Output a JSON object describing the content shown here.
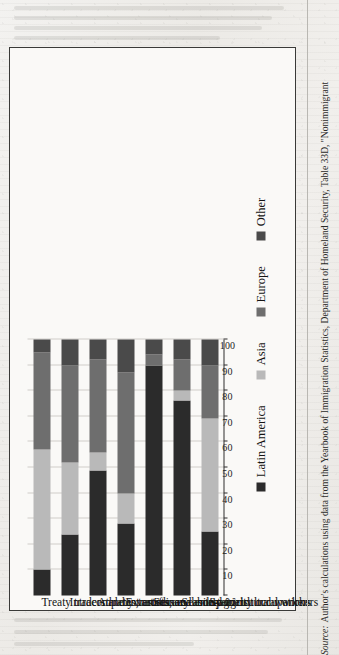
{
  "figure": {
    "source_prefix": "Source:",
    "source_text": "Author's calculations using data from the Yearbook of Immigration Statistics, Department of Homeland Security, Table 33D, \"Nonimmigrant",
    "orientation": "rotated-90-ccw",
    "frame_color": "#3a3a38"
  },
  "legend": {
    "items": [
      {
        "label": "Latin America",
        "color": "#2b2b2b"
      },
      {
        "label": "Asia",
        "color": "#b9b9b9"
      },
      {
        "label": "Europe",
        "color": "#6e6e6e"
      },
      {
        "label": "Other",
        "color": "#4a4a4a"
      }
    ]
  },
  "chart_data": {
    "type": "bar",
    "subtype": "horizontal-stacked-100-percent",
    "title": "",
    "xlabel": "",
    "ylabel": "",
    "xlim": [
      0,
      100
    ],
    "xticks": [
      0,
      10,
      20,
      30,
      40,
      50,
      60,
      70,
      80,
      90,
      100
    ],
    "tick_labels": [
      "0",
      "10",
      "20",
      "30",
      "40",
      "50",
      "60",
      "70",
      "80",
      "90",
      "100"
    ],
    "grid": true,
    "legend_position": "bottom",
    "categories": [
      "Treaty traders and investors",
      "Intracompany transferees",
      "Athletes, artists, and entertainers",
      "Extraordinary ability",
      "Seasonal non-agricultural workers",
      "Seasonal agricultural workers",
      "Specialty occupations"
    ],
    "series": [
      {
        "name": "Latin America",
        "color": "#2b2b2b",
        "values": [
          10,
          24,
          49,
          28,
          90,
          76,
          25
        ]
      },
      {
        "name": "Asia",
        "color": "#b9b9b9",
        "values": [
          47,
          28,
          7,
          12,
          0,
          4,
          44
        ]
      },
      {
        "name": "Europe",
        "color": "#6e6e6e",
        "values": [
          38,
          38,
          36,
          47,
          4,
          12,
          21
        ]
      },
      {
        "name": "Other",
        "color": "#4a4a4a",
        "values": [
          5,
          10,
          8,
          13,
          6,
          8,
          10
        ]
      }
    ]
  }
}
